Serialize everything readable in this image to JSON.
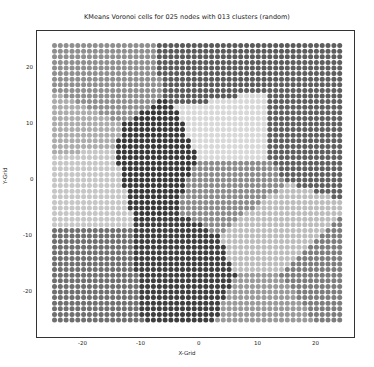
{
  "chart_data": {
    "type": "scatter",
    "title": "KMeans Voronoi cells for 025 nodes with 013 clusters (random)",
    "xlabel": "X-Grid",
    "ylabel": "Y-Grid",
    "xlim": [
      -27,
      26
    ],
    "ylim": [
      -27,
      27
    ],
    "xticks": [
      -20,
      -10,
      0,
      10,
      20
    ],
    "yticks": [
      -20,
      -10,
      0,
      10,
      20
    ],
    "grid": false,
    "legend": null,
    "grid_range": {
      "min": -25,
      "max": 24,
      "step": 1
    },
    "n_clusters": 13,
    "centroids": [
      {
        "x": -17,
        "y": 17,
        "color": "#8f8f8f"
      },
      {
        "x": 3,
        "y": 20,
        "color": "#5a5a5a"
      },
      {
        "x": 18,
        "y": 9,
        "color": "#5e5e5e"
      },
      {
        "x": 5,
        "y": 9,
        "color": "#d8d8d8"
      },
      {
        "x": -8,
        "y": 4,
        "color": "#383838"
      },
      {
        "x": -20,
        "y": 1,
        "color": "#c6c6c6"
      },
      {
        "x": -19,
        "y": -18,
        "color": "#6f6f6f"
      },
      {
        "x": -3,
        "y": -16,
        "color": "#3e3e3e"
      },
      {
        "x": 5,
        "y": -1,
        "color": "#8b8b8b"
      },
      {
        "x": 12,
        "y": -10,
        "color": "#bcbcbc"
      },
      {
        "x": 20,
        "y": -18,
        "color": "#7d7d7d"
      },
      {
        "x": 13,
        "y": -23,
        "color": "#9a9a9a"
      },
      {
        "x": -21,
        "y": 9,
        "color": "#acacac"
      }
    ]
  },
  "labels": {
    "title": "KMeans Voronoi cells for 025 nodes with 013 clusters (random)",
    "xlabel": "X-Grid",
    "ylabel": "Y-Grid",
    "xticks": [
      "-20",
      "-10",
      "0",
      "10",
      "20"
    ],
    "yticks": [
      "20",
      "10",
      "0",
      "-10",
      "-20"
    ]
  }
}
